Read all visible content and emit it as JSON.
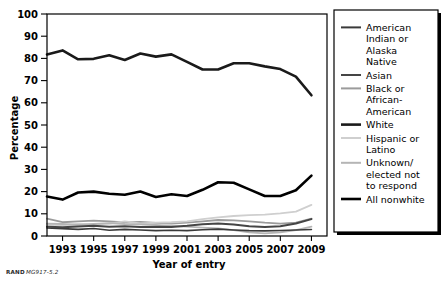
{
  "credit": {
    "org": "RAND",
    "ref": "MG917-5.2"
  },
  "chart_data": {
    "type": "line",
    "title": "",
    "xlabel": "Year of entry",
    "ylabel": "Percentage",
    "xlim": [
      1992,
      2010
    ],
    "ylim": [
      0,
      100
    ],
    "grid": false,
    "legend_position": "right",
    "x": [
      1992,
      1993,
      1994,
      1995,
      1996,
      1997,
      1998,
      1999,
      2000,
      2001,
      2002,
      2003,
      2004,
      2005,
      2006,
      2007,
      2008,
      2009
    ],
    "xticks": [
      1993,
      1995,
      1997,
      1999,
      2001,
      2003,
      2005,
      2007,
      2009
    ],
    "yticks": [
      0,
      10,
      20,
      30,
      40,
      50,
      60,
      70,
      80,
      90,
      100
    ],
    "series": [
      {
        "name": "American Indian or Alaska Native",
        "color": "#3a3a3a",
        "width": 1.6,
        "values": [
          3.6,
          3.3,
          3.0,
          3.4,
          2.6,
          3.0,
          2.7,
          2.4,
          2.6,
          2.4,
          2.8,
          3.1,
          2.7,
          2.4,
          2.3,
          2.5,
          2.7,
          2.9
        ]
      },
      {
        "name": "Asian",
        "color": "#454545",
        "width": 2.0,
        "values": [
          4.2,
          3.9,
          4.3,
          4.6,
          4.2,
          4.4,
          4.0,
          4.2,
          4.1,
          4.6,
          5.3,
          5.6,
          5.2,
          4.4,
          4.0,
          4.4,
          5.6,
          7.6
        ]
      },
      {
        "name": "Black or African-American",
        "color": "#9b9b9b",
        "width": 1.8,
        "values": [
          7.8,
          6.2,
          6.6,
          6.9,
          6.6,
          6.1,
          6.4,
          5.9,
          5.6,
          6.0,
          6.6,
          7.2,
          7.0,
          6.6,
          6.0,
          5.6,
          6.0,
          7.8
        ]
      },
      {
        "name": "White",
        "color": "#1a1a1a",
        "width": 2.6,
        "values": [
          81.8,
          83.6,
          79.6,
          79.8,
          81.4,
          79.3,
          82.2,
          80.8,
          81.8,
          78.4,
          75.0,
          75.0,
          77.8,
          77.8,
          76.4,
          75.2,
          71.8,
          63.4
        ]
      },
      {
        "name": "Hispanic or Latino",
        "color": "#cfcfcf",
        "width": 1.8,
        "values": [
          5.0,
          4.9,
          5.4,
          5.2,
          5.6,
          6.6,
          5.7,
          6.0,
          6.2,
          6.6,
          7.6,
          8.4,
          9.0,
          9.4,
          9.6,
          10.2,
          11.0,
          14.0
        ]
      },
      {
        "name": "Unknown/elected not to respond",
        "color": "#b5b5b5",
        "width": 1.8,
        "values": [
          5.6,
          5.4,
          5.0,
          5.4,
          5.8,
          5.4,
          5.2,
          5.0,
          4.6,
          4.2,
          3.8,
          3.4,
          2.6,
          1.6,
          1.2,
          1.6,
          2.6,
          4.2
        ]
      },
      {
        "name": "All nonwhite",
        "color": "#000000",
        "width": 2.6,
        "values": [
          17.8,
          16.4,
          19.6,
          20.0,
          19.0,
          18.6,
          20.0,
          17.6,
          18.8,
          18.0,
          20.8,
          24.2,
          24.0,
          21.0,
          18.0,
          18.0,
          20.6,
          27.2
        ]
      }
    ]
  },
  "legend": {
    "entries": [
      "American Indian or Alaska Native",
      "Asian",
      "Black or African-American",
      "White",
      "Hispanic or Latino",
      "Unknown/elected not to respond",
      "All nonwhite"
    ],
    "lines": [
      [
        "American",
        "Indian or",
        "Alaska",
        "Native"
      ],
      [
        "Asian"
      ],
      [
        "Black or",
        "African-",
        "American"
      ],
      [
        "White"
      ],
      [
        "Hispanic or",
        "Latino"
      ],
      [
        "Unknown/",
        "elected not",
        "to respond"
      ],
      [
        "All nonwhite"
      ]
    ]
  }
}
